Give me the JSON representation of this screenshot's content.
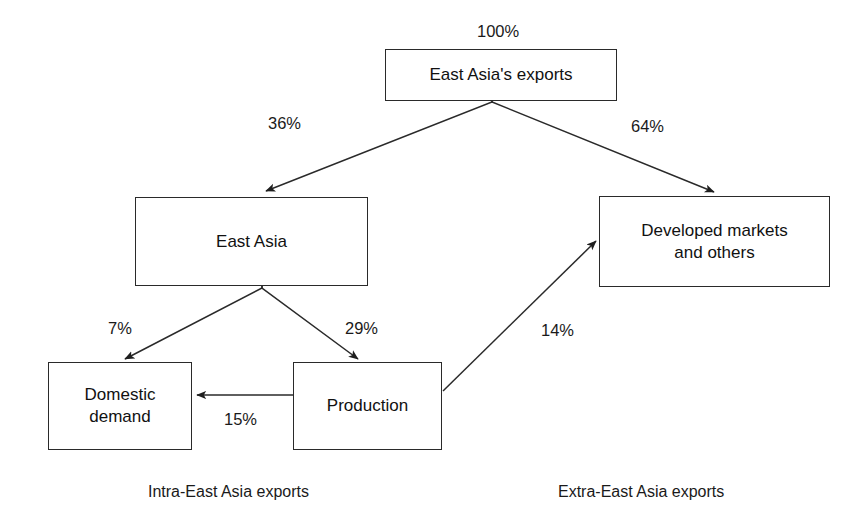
{
  "diagram": {
    "title_label": "East Asia's exports flow diagram",
    "nodes": [
      {
        "id": "east-asia-exports",
        "label": "East Asia's exports",
        "x": 385,
        "y": 49,
        "w": 232,
        "h": 52
      },
      {
        "id": "east-asia",
        "label": "East Asia",
        "x": 135,
        "y": 197,
        "w": 233,
        "h": 89
      },
      {
        "id": "developed-markets",
        "label": "Developed markets\nand others",
        "x": 599,
        "y": 196,
        "w": 231,
        "h": 91
      },
      {
        "id": "domestic-demand",
        "label": "Domestic\ndemand",
        "x": 48,
        "y": 362,
        "w": 144,
        "h": 88
      },
      {
        "id": "production",
        "label": "Production",
        "x": 293,
        "y": 362,
        "w": 149,
        "h": 88
      }
    ],
    "edges": [
      {
        "id": "exports-total",
        "label": "100%",
        "from": "",
        "to": "east-asia-exports",
        "label_x": 477,
        "label_y": 22
      },
      {
        "id": "exports-to-east-asia",
        "label": "36%",
        "from": "east-asia-exports",
        "to": "east-asia",
        "label_x": 268,
        "label_y": 114
      },
      {
        "id": "exports-to-developed",
        "label": "64%",
        "from": "east-asia-exports",
        "to": "developed-markets",
        "label_x": 631,
        "label_y": 117
      },
      {
        "id": "east-asia-to-domestic",
        "label": "7%",
        "from": "east-asia",
        "to": "domestic-demand",
        "label_x": 108,
        "label_y": 319
      },
      {
        "id": "east-asia-to-production",
        "label": "29%",
        "from": "east-asia",
        "to": "production",
        "label_x": 345,
        "label_y": 319
      },
      {
        "id": "production-to-domestic",
        "label": "15%",
        "from": "production",
        "to": "domestic-demand",
        "label_x": 224,
        "label_y": 410
      },
      {
        "id": "production-to-developed",
        "label": "14%",
        "from": "production",
        "to": "developed-markets",
        "label_x": 541,
        "label_y": 321
      }
    ],
    "captions": [
      {
        "id": "intra-east-asia",
        "label": "Intra-East Asia exports",
        "x": 148,
        "y": 483
      },
      {
        "id": "extra-east-asia",
        "label": "Extra-East Asia exports",
        "x": 558,
        "y": 483
      }
    ],
    "colors": {
      "box_border": "#2a2a2a",
      "line": "#2a2a2a",
      "text": "#111111",
      "background": "#ffffff"
    }
  }
}
